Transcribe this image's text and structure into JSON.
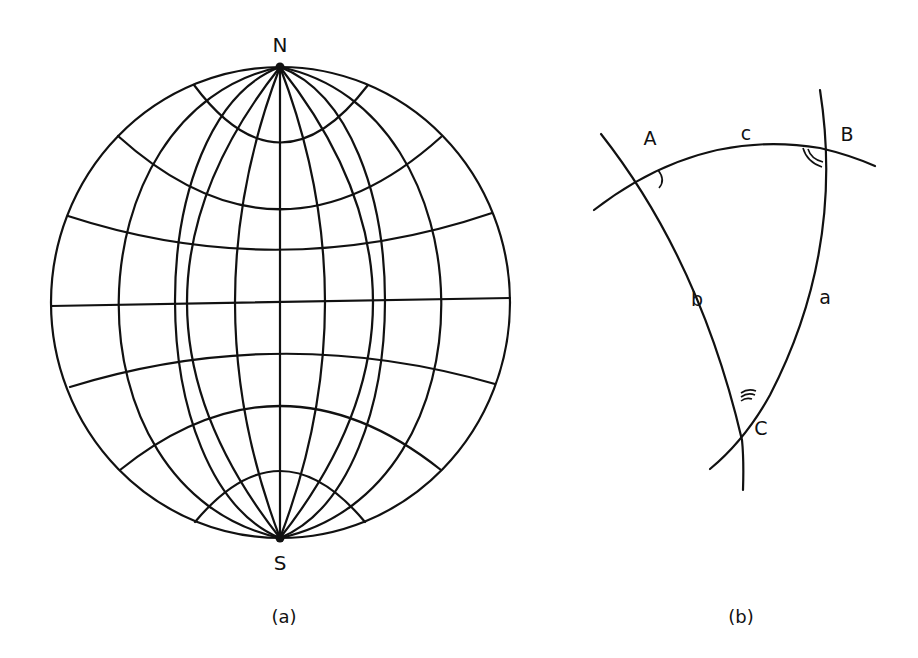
{
  "figure": {
    "panel_a": {
      "caption": "(a)",
      "north_label": "N",
      "south_label": "S",
      "description": "Globe with meridians converging at poles N and S and parallels of latitude"
    },
    "panel_b": {
      "caption": "(b)",
      "vertices": {
        "A": "A",
        "B": "B",
        "C": "C"
      },
      "sides": {
        "a": "a",
        "b": "b",
        "c": "c"
      },
      "description": "Spherical triangle ABC formed by three great-circle arcs, with angle markers at each vertex"
    }
  },
  "colors": {
    "stroke": "#111111",
    "background": "#ffffff"
  }
}
